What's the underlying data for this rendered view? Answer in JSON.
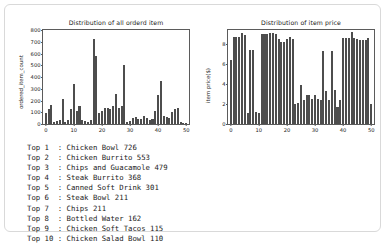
{
  "card": {
    "border_color": "#d9d9d9",
    "background": "#ffffff"
  },
  "top_list": {
    "label_prefix": "Top",
    "items": [
      {
        "rank": 1,
        "line": "Top 1  : Chicken Bowl 726",
        "name": "Chicken Bowl",
        "count": 726
      },
      {
        "rank": 2,
        "line": "Top 2  : Chicken Burrito 553",
        "name": "Chicken Burrito",
        "count": 553
      },
      {
        "rank": 3,
        "line": "Top 3  : Chips and Guacamole 479",
        "name": "Chips and Guacamole",
        "count": 479
      },
      {
        "rank": 4,
        "line": "Top 4  : Steak Burrito 368",
        "name": "Steak Burrito",
        "count": 368
      },
      {
        "rank": 5,
        "line": "Top 5  : Canned Soft Drink 301",
        "name": "Canned Soft Drink",
        "count": 301
      },
      {
        "rank": 6,
        "line": "Top 6  : Steak Bowl 211",
        "name": "Steak Bowl",
        "count": 211
      },
      {
        "rank": 7,
        "line": "Top 7  : Chips 211",
        "name": "Chips",
        "count": 211
      },
      {
        "rank": 8,
        "line": "Top 8  : Bottled Water 162",
        "name": "Bottled Water",
        "count": 162
      },
      {
        "rank": 9,
        "line": "Top 9  : Chicken Soft Tacos 115",
        "name": "Chicken Soft Tacos",
        "count": 115
      },
      {
        "rank": 10,
        "line": "Top 10 : Chicken Salad Bowl 110",
        "name": "Chicken Salad Bowl",
        "count": 110
      }
    ]
  },
  "chart_data": [
    {
      "type": "bar",
      "id": "ordered-item-count",
      "title": "Distribution of all orderd item",
      "xlabel": "",
      "ylabel": "ordered_item_count",
      "bar_color": "#4d4d4d",
      "grid": false,
      "legend": null,
      "xlim": [
        -1,
        51
      ],
      "ylim": [
        0,
        800
      ],
      "xticks": [
        0,
        10,
        20,
        30,
        40,
        50
      ],
      "yticks": [
        0,
        100,
        200,
        300,
        400,
        500,
        600,
        700,
        800
      ],
      "x": [
        0,
        1,
        2,
        3,
        4,
        5,
        6,
        7,
        8,
        9,
        10,
        11,
        12,
        13,
        14,
        15,
        16,
        17,
        18,
        19,
        20,
        21,
        22,
        23,
        24,
        25,
        26,
        27,
        28,
        29,
        30,
        31,
        32,
        33,
        34,
        35,
        36,
        37,
        38,
        39,
        40,
        41,
        42,
        43,
        44,
        45,
        46,
        47,
        48,
        49,
        50
      ],
      "values": [
        95,
        130,
        162,
        20,
        25,
        30,
        211,
        20,
        35,
        130,
        340,
        110,
        150,
        30,
        25,
        20,
        35,
        726,
        580,
        95,
        110,
        135,
        140,
        130,
        150,
        255,
        140,
        150,
        505,
        20,
        25,
        55,
        60,
        45,
        40,
        70,
        55,
        30,
        45,
        110,
        250,
        368,
        70,
        60,
        55,
        100,
        130,
        140,
        20,
        12,
        10
      ]
    },
    {
      "type": "bar",
      "id": "item-price",
      "title": "Distribution of item price",
      "xlabel": "",
      "ylabel": "item price($)",
      "bar_color": "#4d4d4d",
      "grid": false,
      "legend": null,
      "xlim": [
        -1,
        51
      ],
      "ylim": [
        0,
        9.4
      ],
      "xticks": [
        0,
        10,
        20,
        30,
        40,
        50
      ],
      "yticks": [
        0,
        2,
        4,
        6,
        8
      ],
      "x": [
        0,
        1,
        2,
        3,
        4,
        5,
        6,
        7,
        8,
        9,
        10,
        11,
        12,
        13,
        14,
        15,
        16,
        17,
        18,
        19,
        20,
        21,
        22,
        23,
        24,
        25,
        26,
        27,
        28,
        29,
        30,
        31,
        32,
        33,
        34,
        35,
        36,
        37,
        38,
        39,
        40,
        41,
        42,
        43,
        44,
        45,
        46,
        47,
        48,
        49,
        50
      ],
      "values": [
        6.45,
        8.7,
        8.75,
        8.75,
        9.15,
        8.95,
        1.09,
        7.4,
        7.4,
        1.25,
        1.09,
        8.99,
        8.99,
        8.99,
        9.1,
        9.15,
        8.99,
        8.5,
        8.25,
        8.25,
        8.5,
        8.75,
        8.5,
        2.0,
        2.15,
        3.89,
        2.39,
        2.95,
        2.95,
        2.5,
        2.95,
        2.5,
        2.39,
        7.35,
        3.3,
        2.39,
        7.35,
        3.39,
        1.69,
        2.39,
        8.65,
        8.65,
        8.65,
        9.25,
        8.65,
        8.5,
        8.4,
        8.4,
        8.4,
        8.65,
        2.0
      ]
    }
  ]
}
